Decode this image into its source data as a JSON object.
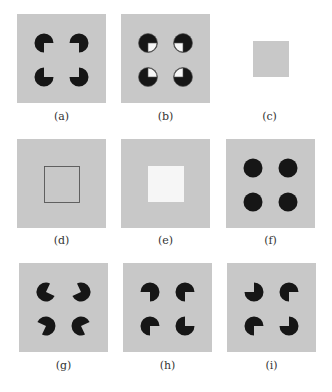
{
  "figure": {
    "colors": {
      "background": "#c8c8c8",
      "page": "#ffffff",
      "inducer": "#161616",
      "square_white": "#f6f6f6",
      "outline": "#555555"
    },
    "panels": [
      {
        "id": "a",
        "caption": "(a)",
        "type": "kanizsa",
        "missing": [
          "br",
          "bl",
          "tr",
          "tl"
        ]
      },
      {
        "id": "b",
        "caption": "(b)",
        "type": "outlined-quadrants",
        "missing": [
          "br",
          "bl",
          "tr",
          "tl"
        ]
      },
      {
        "id": "c",
        "caption": "(c)",
        "type": "gray-square-on-white"
      },
      {
        "id": "d",
        "caption": "(d)",
        "type": "outlined-square"
      },
      {
        "id": "e",
        "caption": "(e)",
        "type": "white-square"
      },
      {
        "id": "f",
        "caption": "(f)",
        "type": "full-disks"
      },
      {
        "id": "g",
        "caption": "(g)",
        "type": "rotated-pacmen",
        "angles": [
          -20,
          200,
          160,
          20
        ]
      },
      {
        "id": "h",
        "caption": "(h)",
        "type": "rotated-pacmen",
        "angles": [
          135,
          45,
          45,
          -45
        ]
      },
      {
        "id": "i",
        "caption": "(i)",
        "type": "rotated-pacmen",
        "angles": [
          225,
          45,
          45,
          225
        ]
      }
    ]
  }
}
